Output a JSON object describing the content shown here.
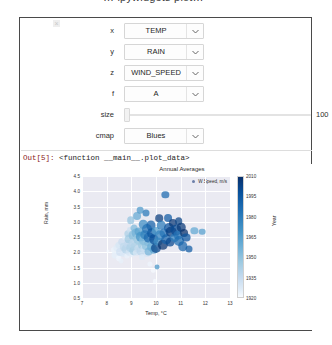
{
  "top_cut_title": "… ipywidgets plot…",
  "panel": {
    "close_label": "×"
  },
  "widgets": {
    "rows": [
      {
        "label": "x",
        "value": "TEMP",
        "type": "dropdown"
      },
      {
        "label": "y",
        "value": "RAIN",
        "type": "dropdown"
      },
      {
        "label": "z",
        "value": "WIND_SPEED",
        "type": "dropdown"
      },
      {
        "label": "f",
        "value": "A",
        "type": "dropdown"
      },
      {
        "label": "size",
        "value": "100",
        "type": "slider"
      },
      {
        "label": "cmap",
        "value": "Blues",
        "type": "dropdown"
      }
    ]
  },
  "output": {
    "prompt": "Out[5]:",
    "text": "<function __main__.plot_data>"
  },
  "chart_data": {
    "type": "scatter",
    "title": "Annual Averages",
    "xlabel": "Temp, °C",
    "ylabel": "Rain, mm",
    "xlim": [
      7,
      13
    ],
    "ylim": [
      0.5,
      4.5
    ],
    "xticks": [
      "7",
      "8",
      "9",
      "10",
      "11",
      "12",
      "13"
    ],
    "yticks": [
      "0.5",
      "1.0",
      "1.5",
      "2.0",
      "2.5",
      "3.0",
      "3.5",
      "4.0",
      "4.5"
    ],
    "grid": true,
    "legend": {
      "position": "upper right",
      "entries": [
        "W Speed, m/s"
      ]
    },
    "colorbar": {
      "label": "Year",
      "cmap": "Blues",
      "ticks": [
        "2010",
        "1995",
        "1980",
        "1965",
        "1950",
        "1935",
        "1920"
      ],
      "vmin": 1920,
      "vmax": 2010
    },
    "size_encodes": "WIND_SPEED",
    "color_encodes": "Year",
    "points": [
      {
        "x": 8.05,
        "y": 2.05,
        "s": 1.6,
        "c": 1922
      },
      {
        "x": 8.3,
        "y": 2.08,
        "s": 2.6,
        "c": 1925
      },
      {
        "x": 8.35,
        "y": 1.9,
        "s": 2.8,
        "c": 1928
      },
      {
        "x": 8.42,
        "y": 2.15,
        "s": 3.0,
        "c": 1931
      },
      {
        "x": 8.48,
        "y": 1.8,
        "s": 2.4,
        "c": 1923
      },
      {
        "x": 8.52,
        "y": 2.25,
        "s": 2.9,
        "c": 1935
      },
      {
        "x": 8.55,
        "y": 2.02,
        "s": 3.2,
        "c": 1938
      },
      {
        "x": 8.6,
        "y": 1.72,
        "s": 2.2,
        "c": 1927
      },
      {
        "x": 8.62,
        "y": 2.35,
        "s": 3.1,
        "c": 1941
      },
      {
        "x": 8.68,
        "y": 1.95,
        "s": 2.7,
        "c": 1933
      },
      {
        "x": 8.72,
        "y": 2.18,
        "s": 3.4,
        "c": 1944
      },
      {
        "x": 8.75,
        "y": 2.48,
        "s": 2.5,
        "c": 1930
      },
      {
        "x": 8.78,
        "y": 2.1,
        "s": 3.6,
        "c": 1947
      },
      {
        "x": 8.82,
        "y": 1.88,
        "s": 2.3,
        "c": 1926
      },
      {
        "x": 8.85,
        "y": 2.6,
        "s": 3.0,
        "c": 1950
      },
      {
        "x": 8.88,
        "y": 2.28,
        "s": 3.3,
        "c": 1943
      },
      {
        "x": 8.9,
        "y": 2.0,
        "s": 2.8,
        "c": 1936
      },
      {
        "x": 8.92,
        "y": 2.42,
        "s": 3.5,
        "c": 1953
      },
      {
        "x": 8.95,
        "y": 2.72,
        "s": 2.6,
        "c": 1939
      },
      {
        "x": 8.98,
        "y": 3.05,
        "s": 3.1,
        "c": 1956
      },
      {
        "x": 9.0,
        "y": 2.15,
        "s": 3.8,
        "c": 1949
      },
      {
        "x": 9.02,
        "y": 1.92,
        "s": 2.4,
        "c": 1929
      },
      {
        "x": 9.05,
        "y": 2.55,
        "s": 3.4,
        "c": 1958
      },
      {
        "x": 9.08,
        "y": 2.3,
        "s": 3.0,
        "c": 1945
      },
      {
        "x": 9.1,
        "y": 2.05,
        "s": 3.7,
        "c": 1952
      },
      {
        "x": 9.12,
        "y": 2.8,
        "s": 2.9,
        "c": 1961
      },
      {
        "x": 9.15,
        "y": 2.22,
        "s": 3.3,
        "c": 1948
      },
      {
        "x": 9.18,
        "y": 2.62,
        "s": 3.6,
        "c": 1964
      },
      {
        "x": 9.2,
        "y": 1.98,
        "s": 2.7,
        "c": 1934
      },
      {
        "x": 9.22,
        "y": 3.2,
        "s": 3.2,
        "c": 1967
      },
      {
        "x": 9.25,
        "y": 2.45,
        "s": 3.9,
        "c": 1955
      },
      {
        "x": 9.28,
        "y": 2.12,
        "s": 3.1,
        "c": 1942
      },
      {
        "x": 9.3,
        "y": 2.68,
        "s": 3.5,
        "c": 1970
      },
      {
        "x": 9.32,
        "y": 2.35,
        "s": 3.0,
        "c": 1951
      },
      {
        "x": 9.35,
        "y": 3.38,
        "s": 2.8,
        "c": 1973
      },
      {
        "x": 9.38,
        "y": 2.05,
        "s": 3.6,
        "c": 1946
      },
      {
        "x": 9.4,
        "y": 2.5,
        "s": 4.0,
        "c": 1976
      },
      {
        "x": 9.42,
        "y": 2.25,
        "s": 3.2,
        "c": 1954
      },
      {
        "x": 9.45,
        "y": 1.85,
        "s": 2.5,
        "c": 1932
      },
      {
        "x": 9.48,
        "y": 2.92,
        "s": 3.4,
        "c": 1979
      },
      {
        "x": 9.5,
        "y": 2.4,
        "s": 3.8,
        "c": 1959
      },
      {
        "x": 9.52,
        "y": 2.1,
        "s": 3.0,
        "c": 1940
      },
      {
        "x": 9.55,
        "y": 2.58,
        "s": 3.7,
        "c": 1982
      },
      {
        "x": 9.58,
        "y": 2.2,
        "s": 3.3,
        "c": 1957
      },
      {
        "x": 9.6,
        "y": 3.3,
        "s": 2.9,
        "c": 1985
      },
      {
        "x": 9.62,
        "y": 1.95,
        "s": 2.6,
        "c": 1937
      },
      {
        "x": 9.65,
        "y": 2.75,
        "s": 3.9,
        "c": 1988
      },
      {
        "x": 9.68,
        "y": 2.32,
        "s": 3.1,
        "c": 1960
      },
      {
        "x": 9.7,
        "y": 2.02,
        "s": 3.5,
        "c": 1963
      },
      {
        "x": 9.72,
        "y": 2.48,
        "s": 4.1,
        "c": 1991
      },
      {
        "x": 9.75,
        "y": 1.62,
        "s": 2.3,
        "c": 1924
      },
      {
        "x": 9.78,
        "y": 2.88,
        "s": 3.6,
        "c": 1994
      },
      {
        "x": 9.8,
        "y": 2.18,
        "s": 3.2,
        "c": 1966
      },
      {
        "x": 9.82,
        "y": 2.62,
        "s": 3.8,
        "c": 1997
      },
      {
        "x": 9.85,
        "y": 2.28,
        "s": 3.0,
        "c": 1962
      },
      {
        "x": 9.88,
        "y": 1.4,
        "s": 2.1,
        "c": 1921
      },
      {
        "x": 9.9,
        "y": 2.08,
        "s": 3.4,
        "c": 1969
      },
      {
        "x": 9.92,
        "y": 2.42,
        "s": 3.7,
        "c": 2000
      },
      {
        "x": 9.95,
        "y": 1.05,
        "s": 2.0,
        "c": 1920
      },
      {
        "x": 9.98,
        "y": 2.7,
        "s": 3.3,
        "c": 1972
      },
      {
        "x": 10.0,
        "y": 2.15,
        "s": 3.9,
        "c": 2003
      },
      {
        "x": 10.05,
        "y": 1.52,
        "s": 2.2,
        "c": 1975
      },
      {
        "x": 10.08,
        "y": 2.35,
        "s": 3.5,
        "c": 1978
      },
      {
        "x": 10.12,
        "y": 3.12,
        "s": 3.1,
        "c": 2006
      },
      {
        "x": 10.18,
        "y": 2.55,
        "s": 3.8,
        "c": 1981
      },
      {
        "x": 10.22,
        "y": 2.88,
        "s": 3.4,
        "c": 1984
      },
      {
        "x": 10.28,
        "y": 2.25,
        "s": 4.0,
        "c": 2009
      },
      {
        "x": 10.32,
        "y": 2.62,
        "s": 3.6,
        "c": 1987
      },
      {
        "x": 10.38,
        "y": 3.88,
        "s": 3.0,
        "c": 1990
      },
      {
        "x": 10.42,
        "y": 2.42,
        "s": 3.7,
        "c": 1993
      },
      {
        "x": 10.48,
        "y": 3.12,
        "s": 3.2,
        "c": 1996
      },
      {
        "x": 10.52,
        "y": 2.78,
        "s": 3.9,
        "c": 1999
      },
      {
        "x": 10.58,
        "y": 2.32,
        "s": 3.5,
        "c": 2002
      },
      {
        "x": 10.62,
        "y": 2.68,
        "s": 4.1,
        "c": 2005
      },
      {
        "x": 10.7,
        "y": 2.95,
        "s": 3.3,
        "c": 2008
      },
      {
        "x": 10.75,
        "y": 2.48,
        "s": 3.8,
        "c": 1983
      },
      {
        "x": 10.82,
        "y": 2.72,
        "s": 4.2,
        "c": 2001
      },
      {
        "x": 10.88,
        "y": 2.58,
        "s": 3.6,
        "c": 1986
      },
      {
        "x": 10.92,
        "y": 3.02,
        "s": 3.1,
        "c": 2004
      },
      {
        "x": 10.95,
        "y": 2.38,
        "s": 3.9,
        "c": 1989
      },
      {
        "x": 11.02,
        "y": 2.82,
        "s": 3.4,
        "c": 2007
      },
      {
        "x": 11.08,
        "y": 2.2,
        "s": 3.7,
        "c": 1992
      },
      {
        "x": 11.15,
        "y": 2.62,
        "s": 3.2,
        "c": 2010
      },
      {
        "x": 11.22,
        "y": 2.48,
        "s": 3.5,
        "c": 1998
      },
      {
        "x": 11.35,
        "y": 2.1,
        "s": 2.9,
        "c": 1995
      },
      {
        "x": 11.55,
        "y": 2.7,
        "s": 3.0,
        "c": 1968
      },
      {
        "x": 11.88,
        "y": 2.68,
        "s": 2.8,
        "c": 1971
      }
    ]
  }
}
